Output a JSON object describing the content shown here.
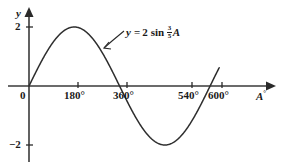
{
  "chart_data": {
    "type": "line",
    "title": "",
    "equation_label": {
      "lhs": "y",
      "eq": "=",
      "amplitude": "2",
      "function": "sin",
      "coefficient_numerator": "3",
      "coefficient_denominator": "5",
      "variable": "A"
    },
    "xlabel": "A",
    "xlabel_degree_symbol": "°",
    "ylabel": "y",
    "xlim": [
      -60,
      660
    ],
    "ylim": [
      -2.75,
      2.75
    ],
    "xticks": [
      0,
      180,
      360,
      540,
      600
    ],
    "xtick_labels": [
      "0",
      "180°",
      "360°",
      "540°",
      "600°"
    ],
    "yticks": [
      2,
      -2
    ],
    "ytick_labels": [
      "2",
      "−2"
    ],
    "grid": false,
    "legend": "none",
    "amplitude": 2,
    "period_degrees": 600,
    "x": [
      0,
      30,
      60,
      90,
      120,
      150,
      180,
      210,
      240,
      270,
      300,
      330,
      360,
      390,
      420,
      450,
      480,
      510,
      540,
      570,
      600,
      630
    ],
    "values": [
      0,
      0.618,
      1.176,
      1.618,
      1.902,
      2.0,
      1.902,
      1.618,
      1.176,
      0.618,
      0.0,
      -0.618,
      -1.176,
      -1.618,
      -1.902,
      -2.0,
      -1.902,
      -1.618,
      -1.176,
      -0.618,
      0.0,
      0.618
    ],
    "annotations": [
      {
        "text": "y = 2 sin 3/5 A",
        "points_to_x": 258,
        "points_to_y": 1.28
      }
    ]
  },
  "axes": {
    "y_axis_name": "y",
    "x_axis_name": "A",
    "degree_symbol": "°",
    "origin_label": "0",
    "y_top_label": "2",
    "y_bottom_label": "−2",
    "x_labels": [
      "180°",
      "360°",
      "540°",
      "600°"
    ]
  },
  "colors": {
    "ink": "#1a1a1a",
    "curve": "#333333",
    "background": "#ffffff"
  }
}
